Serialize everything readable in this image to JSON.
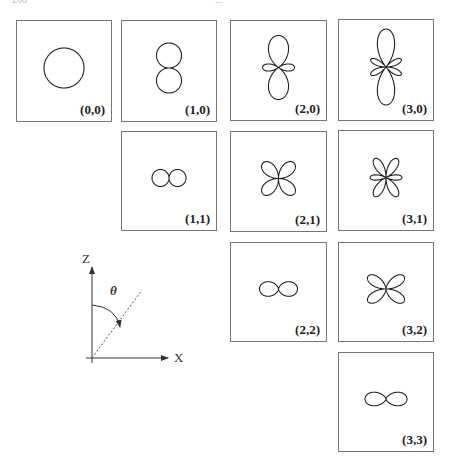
{
  "header": {
    "page_number": "200",
    "running_title": "..."
  },
  "panels": [
    {
      "label": "(0,0)",
      "l": 0,
      "m": 0,
      "x": 16,
      "y": 20,
      "w": 96,
      "h": 102,
      "scale": 20
    },
    {
      "label": "(1,0)",
      "l": 1,
      "m": 0,
      "x": 121,
      "y": 20,
      "w": 96,
      "h": 102,
      "scale": 25
    },
    {
      "label": "(2,0)",
      "l": 2,
      "m": 0,
      "x": 230,
      "y": 20,
      "w": 97,
      "h": 101,
      "scale": 32
    },
    {
      "label": "(3,0)",
      "l": 3,
      "m": 0,
      "x": 338,
      "y": 19,
      "w": 96,
      "h": 102,
      "scale": 38
    },
    {
      "label": "(1,1)",
      "l": 1,
      "m": 1,
      "x": 121,
      "y": 131,
      "w": 96,
      "h": 100,
      "scale": 17
    },
    {
      "label": "(2,1)",
      "l": 2,
      "m": 1,
      "x": 230,
      "y": 131,
      "w": 97,
      "h": 101,
      "scale": 22
    },
    {
      "label": "(3,1)",
      "l": 3,
      "m": 1,
      "x": 338,
      "y": 130,
      "w": 96,
      "h": 101,
      "scale": 22
    },
    {
      "label": "(2,2)",
      "l": 2,
      "m": 2,
      "x": 230,
      "y": 242,
      "w": 97,
      "h": 100,
      "scale": 19
    },
    {
      "label": "(3,2)",
      "l": 3,
      "m": 2,
      "x": 338,
      "y": 242,
      "w": 96,
      "h": 100,
      "scale": 22
    },
    {
      "label": "(3,3)",
      "l": 3,
      "m": 3,
      "x": 338,
      "y": 352,
      "w": 96,
      "h": 100,
      "scale": 21
    }
  ],
  "axes": {
    "z_label": "Z",
    "x_label": "X",
    "angle_label": "θ",
    "description": "Coordinate axes showing polar angle theta measured from the z-axis"
  },
  "colors": {
    "line": "#222222",
    "border": "#777777",
    "background": "#ffffff"
  }
}
